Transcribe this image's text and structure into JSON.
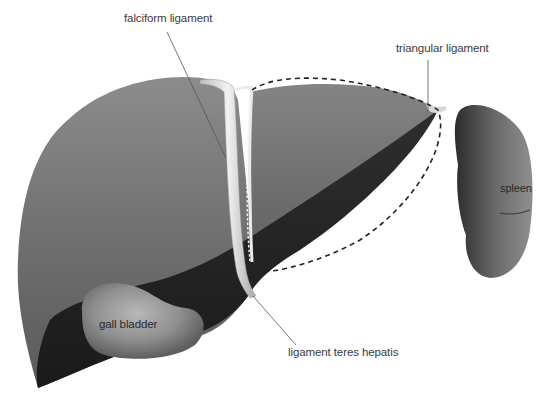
{
  "diagram": {
    "labels": {
      "falciform": "falciform ligament",
      "triangular": "triangular ligament",
      "spleen": "spleen",
      "gall_bladder": "gall bladder",
      "teres": "ligament teres hepatis"
    },
    "colors": {
      "background": "#ffffff",
      "liver_light": "#8a8a8a",
      "liver_mid": "#6f6f6f",
      "liver_dark": "#3a3a3a",
      "liver_shadow": "#1e1e1e",
      "ligament": "#e6e6e6",
      "gall_bladder": "#9a9a9a",
      "spleen": "#7a7a7a",
      "leader_line": "#555555",
      "dashed_outline": "#222222",
      "text": "#3a3a3a"
    }
  }
}
